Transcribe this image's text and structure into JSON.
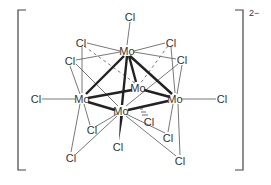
{
  "charge": "2−",
  "atoms": {
    "mo_top": {
      "label": "Mo",
      "x": 127,
      "y": 51
    },
    "mo_back": {
      "label": "Mo",
      "x": 138,
      "y": 88
    },
    "mo_left": {
      "label": "Mo",
      "x": 82,
      "y": 99
    },
    "mo_right": {
      "label": "Mo",
      "x": 175,
      "y": 99
    },
    "mo_front": {
      "label": "Mo",
      "x": 121,
      "y": 111
    },
    "cl_top": {
      "label": "Cl",
      "x": 130,
      "y": 17
    },
    "cl_ul": {
      "label": "Cl",
      "x": 81,
      "y": 43
    },
    "cl_ur": {
      "label": "Cl",
      "x": 171,
      "y": 43
    },
    "cl_l2": {
      "label": "Cl",
      "x": 70,
      "y": 61
    },
    "cl_r2": {
      "label": "Cl",
      "x": 182,
      "y": 60
    },
    "cl_left": {
      "label": "Cl",
      "x": 36,
      "y": 99
    },
    "cl_right": {
      "label": "Cl",
      "x": 222,
      "y": 99
    },
    "cl_hash": {
      "label": "Cl",
      "x": 149,
      "y": 122
    },
    "cl_ll": {
      "label": "Cl",
      "x": 92,
      "y": 130
    },
    "cl_lr": {
      "label": "Cl",
      "x": 168,
      "y": 138
    },
    "cl_bottom": {
      "label": "Cl",
      "x": 118,
      "y": 147
    },
    "cl_bl": {
      "label": "Cl",
      "x": 71,
      "y": 158
    },
    "cl_br": {
      "label": "Cl",
      "x": 180,
      "y": 161
    }
  }
}
